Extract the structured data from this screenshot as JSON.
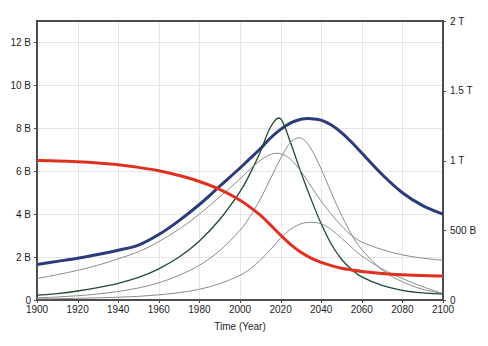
{
  "chart_data": {
    "type": "line",
    "title": "",
    "subtitle": "",
    "xlabel": "Time (Year)",
    "ylabel": "",
    "ylabel_right": "",
    "xlim": [
      1900,
      2100
    ],
    "ylim": [
      0,
      13
    ],
    "ylim_right": [
      0,
      2
    ],
    "grid": true,
    "legend": "none",
    "background": "#ffffff",
    "frame_color": "#4d4d4d",
    "grid_color": "#e6e6e6",
    "x_ticks": [
      1900,
      1920,
      1940,
      1960,
      1980,
      2000,
      2020,
      2040,
      2060,
      2080,
      2100
    ],
    "x_tick_labels": [
      "1900",
      "1920",
      "1940",
      "1960",
      "1980",
      "2000",
      "2020",
      "2040",
      "2060",
      "2080",
      "2100"
    ],
    "y_ticks_left": [
      0,
      2,
      4,
      6,
      8,
      10,
      12
    ],
    "y_tick_labels_left": [
      "0",
      "2 B",
      "4 B",
      "6 B",
      "8 B",
      "10 B",
      "12 B"
    ],
    "y_ticks_right": [
      0,
      0.5,
      1,
      1.5,
      2
    ],
    "y_tick_labels_right": [
      "0",
      "500 B",
      "1 T",
      "1.5 T",
      "2 T"
    ],
    "x": [
      1900,
      1910,
      1920,
      1930,
      1940,
      1950,
      1960,
      1970,
      1980,
      1990,
      2000,
      2005,
      2010,
      2015,
      2020,
      2025,
      2030,
      2035,
      2040,
      2045,
      2050,
      2055,
      2060,
      2070,
      2080,
      2090,
      2100
    ],
    "series": [
      {
        "name": "population",
        "color": "#2b3a7a",
        "width": 3.0,
        "axis": "left",
        "values": [
          1.65,
          1.8,
          1.95,
          2.12,
          2.32,
          2.56,
          3.05,
          3.7,
          4.45,
          5.3,
          6.15,
          6.6,
          7.05,
          7.55,
          7.95,
          8.25,
          8.42,
          8.45,
          8.38,
          8.15,
          7.8,
          7.35,
          6.85,
          5.85,
          5.0,
          4.4,
          4.0
        ]
      },
      {
        "name": "industrial-output",
        "color": "#1e4a2e",
        "width": 1.3,
        "axis": "left",
        "values": [
          0.22,
          0.3,
          0.42,
          0.58,
          0.78,
          1.05,
          1.45,
          2.0,
          2.75,
          3.75,
          5.05,
          5.9,
          6.9,
          8.05,
          8.45,
          7.3,
          5.95,
          4.7,
          3.55,
          2.6,
          1.9,
          1.42,
          1.08,
          0.68,
          0.45,
          0.33,
          0.28
        ]
      },
      {
        "name": "food",
        "color": "#7a7f7c",
        "width": 0.9,
        "axis": "left",
        "values": [
          1.0,
          1.18,
          1.38,
          1.62,
          1.92,
          2.25,
          2.72,
          3.3,
          4.0,
          4.8,
          5.65,
          6.1,
          6.5,
          6.78,
          6.82,
          6.55,
          6.0,
          5.3,
          4.6,
          4.0,
          3.45,
          3.0,
          2.7,
          2.35,
          2.1,
          1.95,
          1.85
        ]
      },
      {
        "name": "services",
        "color": "#7a7f7c",
        "width": 0.9,
        "axis": "left",
        "values": [
          0.1,
          0.14,
          0.2,
          0.28,
          0.4,
          0.56,
          0.8,
          1.15,
          1.62,
          2.3,
          3.25,
          3.9,
          4.7,
          5.65,
          6.6,
          7.35,
          7.55,
          7.05,
          6.1,
          5.0,
          3.95,
          3.05,
          2.35,
          1.4,
          0.85,
          0.5,
          0.3
        ]
      },
      {
        "name": "pollution",
        "color": "#7a7f7c",
        "width": 0.9,
        "axis": "left",
        "values": [
          0.05,
          0.06,
          0.08,
          0.1,
          0.13,
          0.17,
          0.24,
          0.34,
          0.5,
          0.76,
          1.15,
          1.45,
          1.85,
          2.35,
          2.88,
          3.3,
          3.55,
          3.62,
          3.55,
          3.28,
          2.88,
          2.45,
          2.05,
          1.45,
          1.0,
          0.62,
          0.3
        ]
      },
      {
        "name": "resources",
        "color": "#e03020",
        "width": 3.0,
        "axis": "left",
        "values": [
          6.5,
          6.48,
          6.44,
          6.38,
          6.3,
          6.18,
          6.02,
          5.8,
          5.52,
          5.15,
          4.65,
          4.32,
          3.95,
          3.5,
          3.02,
          2.58,
          2.22,
          1.95,
          1.75,
          1.6,
          1.48,
          1.4,
          1.33,
          1.24,
          1.18,
          1.14,
          1.12
        ]
      }
    ],
    "annotations": []
  },
  "plot_geometry": {
    "left": 37,
    "right": 443,
    "top": 21,
    "bottom": 300
  }
}
